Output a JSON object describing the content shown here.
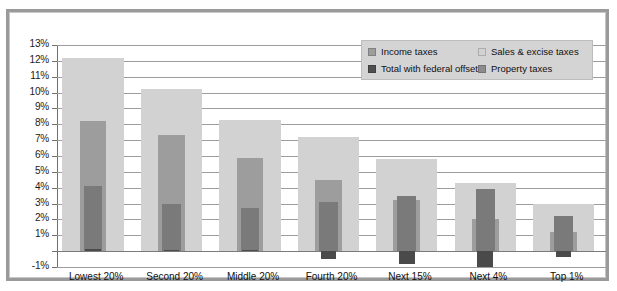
{
  "chart_data": {
    "type": "bar",
    "title": "",
    "subtitle": "",
    "xlabel": "",
    "ylabel": "",
    "ylim": [
      -1,
      13
    ],
    "ytick_step": 1,
    "ytick_labels": [
      "13%",
      "12%",
      "11%",
      "10%",
      "9%",
      "8%",
      "7%",
      "6%",
      "5%",
      "4%",
      "3%",
      "2%",
      "1%",
      "0%",
      "-1%"
    ],
    "grid": true,
    "legend_position": "top-right",
    "categories": [
      "Lowest 20%",
      "Second 20%",
      "Middle 20%",
      "Fourth 20%",
      "Next 15%",
      "Next 4%",
      "Top 1%"
    ],
    "series": [
      {
        "name": "Sales & excise taxes",
        "color": "#d2d2d2",
        "values": [
          12.2,
          10.2,
          8.3,
          7.2,
          5.8,
          4.3,
          3.0
        ]
      },
      {
        "name": "Income taxes",
        "color": "#9d9d9d",
        "values": [
          8.2,
          7.3,
          5.9,
          4.5,
          3.2,
          2.0,
          1.2
        ]
      },
      {
        "name": "Total with federal offset",
        "color": "#7a7a7a",
        "values": [
          4.1,
          3.0,
          2.7,
          3.1,
          3.5,
          3.9,
          2.2
        ]
      },
      {
        "name": "Property taxes",
        "color": "#4a4a4a",
        "values": [
          0.15,
          0.05,
          0.1,
          -0.5,
          -0.8,
          -1.0,
          -0.4
        ]
      }
    ]
  },
  "legend": {
    "items": [
      {
        "label": "Income taxes",
        "color": "#9d9d9d"
      },
      {
        "label": "Sales & excise taxes",
        "color": "#d2d2d2"
      },
      {
        "label": "Total with federal offset",
        "color": "#4f4f4f"
      },
      {
        "label": "Property taxes",
        "color": "#8c8c8c"
      }
    ]
  },
  "colors": {
    "frame": "#9a9a9a",
    "gridline": "#9d9d9d",
    "axis": "#6f6f6f",
    "legend_background": "#d4d4d4",
    "text": "#111111",
    "background": "#ffffff"
  }
}
